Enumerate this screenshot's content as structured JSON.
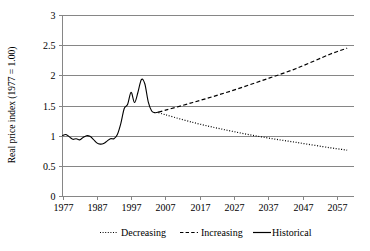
{
  "chart_data": {
    "type": "line",
    "title": "",
    "xlabel": "",
    "ylabel": "Real price index (1977 = 1.00)",
    "xlim": [
      1977,
      2062
    ],
    "ylim": [
      0,
      3
    ],
    "yticks": [
      "0",
      "0.5",
      "1",
      "1.5",
      "2",
      "2.5",
      "3"
    ],
    "ytick_values": [
      0,
      0.5,
      1,
      1.5,
      2,
      2.5,
      3
    ],
    "xticks": [
      "1977",
      "1987",
      "1997",
      "2007",
      "2017",
      "2027",
      "2037",
      "2047",
      "2057"
    ],
    "xtick_values": [
      1977,
      1987,
      1997,
      2007,
      2017,
      2027,
      2037,
      2047,
      2057
    ],
    "grid": "horizontal",
    "legend_position": "bottom",
    "legend": [
      "Decreasing",
      "Increasing",
      "Historical"
    ],
    "series": [
      {
        "name": "Historical",
        "style": "solid",
        "x": [
          1977,
          1978,
          1979,
          1980,
          1981,
          1982,
          1983,
          1984,
          1985,
          1986,
          1987,
          1988,
          1989,
          1990,
          1991,
          1992,
          1993,
          1994,
          1995,
          1996,
          1997,
          1998,
          1999,
          2000,
          2001,
          2002,
          2003,
          2004,
          2005
        ],
        "values": [
          1.0,
          1.02,
          0.98,
          0.94,
          0.95,
          0.93,
          0.97,
          1.0,
          0.99,
          0.94,
          0.88,
          0.86,
          0.87,
          0.91,
          0.95,
          0.95,
          1.02,
          1.2,
          1.45,
          1.52,
          1.72,
          1.55,
          1.72,
          1.93,
          1.86,
          1.56,
          1.41,
          1.38,
          1.39
        ]
      },
      {
        "name": "Increasing",
        "style": "dashed",
        "x": [
          2005,
          2015,
          2025,
          2035,
          2045,
          2055,
          2060
        ],
        "values": [
          1.39,
          1.55,
          1.72,
          1.91,
          2.11,
          2.35,
          2.45
        ]
      },
      {
        "name": "Decreasing",
        "style": "dotted",
        "x": [
          2005,
          2015,
          2025,
          2035,
          2045,
          2055,
          2060
        ],
        "values": [
          1.38,
          1.22,
          1.09,
          0.98,
          0.89,
          0.8,
          0.76
        ]
      }
    ]
  },
  "colors": {
    "line": "#000000",
    "grid": "#868686",
    "background": "#ffffff"
  }
}
